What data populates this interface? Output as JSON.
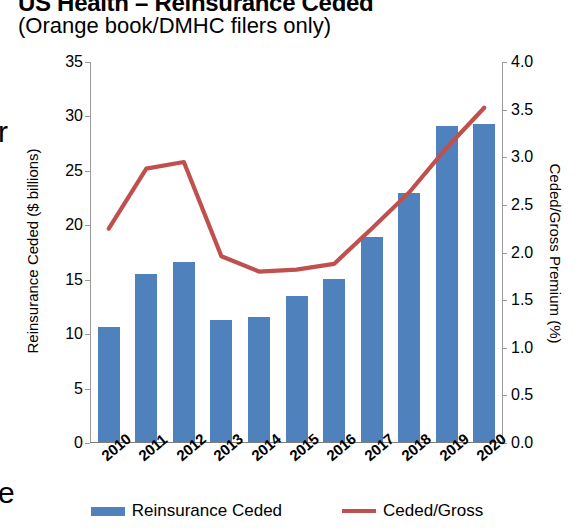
{
  "header": {
    "title": "US Health – Reinsurance Ceded",
    "subtitle": "(Orange book/DMHC filers only)"
  },
  "stray_glyphs": {
    "left_upper": "r",
    "left_lower": "e"
  },
  "legend": {
    "items": [
      {
        "label": "Reinsurance Ceded",
        "type": "bar",
        "color": "#4f81bd"
      },
      {
        "label": "Ceded/Gross",
        "type": "line",
        "color": "#c0504d"
      }
    ]
  },
  "chart_data": {
    "type": "bar",
    "title": "US Health – Reinsurance Ceded",
    "subtitle": "(Orange book/DMHC filers only)",
    "xlabel": "",
    "ylabel": "Reinsurance Ceded ($ billions)",
    "y2label": "Ceded/Gross Premium (%)",
    "categories": [
      "2010",
      "2011",
      "2012",
      "2013",
      "2014",
      "2015",
      "2016",
      "2017",
      "2018",
      "2019",
      "2020"
    ],
    "ylim": [
      0,
      35
    ],
    "y2lim": [
      0,
      4.0
    ],
    "yticks": [
      "0",
      "5",
      "10",
      "15",
      "20",
      "25",
      "30",
      "35"
    ],
    "y2ticks": [
      "0.0",
      "0.5",
      "1.0",
      "1.5",
      "2.0",
      "2.5",
      "3.0",
      "3.5",
      "4.0"
    ],
    "grid": false,
    "legend_position": "bottom",
    "series": [
      {
        "name": "Reinsurance Ceded",
        "type": "bar",
        "axis": "left",
        "color": "#4f81bd",
        "values": [
          10.6,
          15.4,
          16.5,
          11.2,
          11.5,
          13.4,
          15.0,
          18.8,
          22.9,
          29.0,
          29.2
        ]
      },
      {
        "name": "Ceded/Gross",
        "type": "line",
        "axis": "right",
        "color": "#c0504d",
        "values": [
          2.25,
          2.88,
          2.95,
          1.96,
          1.8,
          1.82,
          1.88,
          2.25,
          2.63,
          3.1,
          3.52
        ]
      }
    ]
  }
}
